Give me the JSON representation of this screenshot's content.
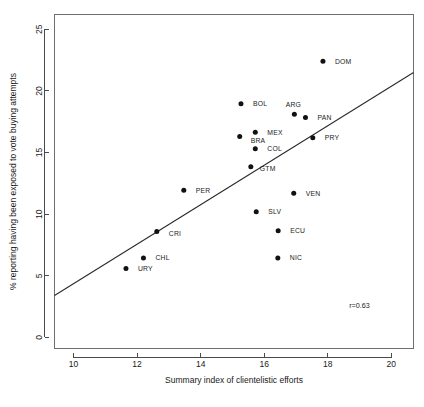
{
  "chart_data": {
    "type": "scatter",
    "title": "",
    "xlabel": "Summary index of clientelistic efforts",
    "ylabel": "% reporting having been exposed to vote buying attempts",
    "xlim": [
      9.4,
      20.7
    ],
    "ylim": [
      -0.9,
      26.2
    ],
    "xticks": [
      10,
      12,
      14,
      16,
      18,
      20
    ],
    "yticks": [
      0,
      5,
      10,
      15,
      20,
      25
    ],
    "xtick_labels": [
      "10",
      "12",
      "14",
      "16",
      "18",
      "20"
    ],
    "ytick_labels": [
      "0",
      "5",
      "10",
      "15",
      "20",
      "25"
    ],
    "grid": false,
    "legend": "none",
    "annotations": [
      {
        "text": "r=0.63",
        "x": 19.0,
        "y": 2.4
      }
    ],
    "fit_line": {
      "type": "linear",
      "x_start": 9.4,
      "y_start": 3.4,
      "x_end": 20.7,
      "y_end": 21.5
    },
    "point_labels": [
      "DOM",
      "BOL",
      "ARG",
      "PAN",
      "MEX",
      "BRA",
      "PRY",
      "COL",
      "GTM",
      "PER",
      "VEN",
      "SLV",
      "CRI",
      "ECU",
      "CHL",
      "NIC",
      "URY"
    ],
    "points": [
      {
        "label": "DOM",
        "x": 17.85,
        "y": 22.4,
        "lx": 12,
        "ly": 2.5
      },
      {
        "label": "BOL",
        "x": 15.27,
        "y": 18.95,
        "lx": 12,
        "ly": 2.5
      },
      {
        "label": "ARG",
        "x": 16.95,
        "y": 18.1,
        "lx": -1,
        "ly": -7
      },
      {
        "label": "PAN",
        "x": 17.3,
        "y": 17.85,
        "lx": 12,
        "ly": 2.5
      },
      {
        "label": "MEX",
        "x": 15.72,
        "y": 16.65,
        "lx": 12,
        "ly": 2.5
      },
      {
        "label": "BRA",
        "x": 15.23,
        "y": 16.3,
        "lx": 11,
        "ly": 6
      },
      {
        "label": "PRY",
        "x": 17.53,
        "y": 16.2,
        "lx": 12,
        "ly": 2.5
      },
      {
        "label": "COL",
        "x": 15.72,
        "y": 15.3,
        "lx": 12,
        "ly": 2.5
      },
      {
        "label": "GTM",
        "x": 15.58,
        "y": 13.85,
        "lx": 9,
        "ly": 4
      },
      {
        "label": "PER",
        "x": 13.47,
        "y": 11.95,
        "lx": 12,
        "ly": 2.5
      },
      {
        "label": "VEN",
        "x": 16.93,
        "y": 11.7,
        "lx": 12,
        "ly": 2.5
      },
      {
        "label": "SLV",
        "x": 15.75,
        "y": 10.2,
        "lx": 12,
        "ly": 2.5
      },
      {
        "label": "CRI",
        "x": 12.62,
        "y": 8.6,
        "lx": 12,
        "ly": 5
      },
      {
        "label": "ECU",
        "x": 16.44,
        "y": 8.65,
        "lx": 12,
        "ly": 2.5
      },
      {
        "label": "CHL",
        "x": 12.2,
        "y": 6.45,
        "lx": 12,
        "ly": 2.5
      },
      {
        "label": "NIC",
        "x": 16.43,
        "y": 6.45,
        "lx": 12,
        "ly": 2.5
      },
      {
        "label": "URY",
        "x": 11.65,
        "y": 5.6,
        "lx": 12,
        "ly": 2.5
      }
    ]
  },
  "axes": {
    "x_title": "Summary index of clientelistic efforts",
    "y_title": "% reporting having been exposed to vote buying attempts"
  },
  "correlation": {
    "label": "r=0.63"
  }
}
